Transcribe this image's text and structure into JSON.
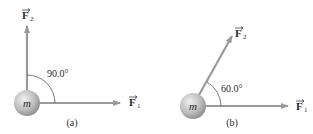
{
  "diagram": {
    "panels": [
      {
        "id": "a",
        "caption": "(a)",
        "mass_label": "m",
        "angle_label": "90.0°",
        "force1": {
          "name": "F",
          "subscript": "1"
        },
        "force2": {
          "name": "F",
          "subscript": "2"
        }
      },
      {
        "id": "b",
        "caption": "(b)",
        "mass_label": "m",
        "angle_label": "60.0°",
        "force1": {
          "name": "F",
          "subscript": "1"
        },
        "force2": {
          "name": "F",
          "subscript": "2"
        }
      }
    ],
    "colors": {
      "arrow": "#9a9a9a",
      "ball_light": "#e6e6e6",
      "ball_dark": "#8c8c8c",
      "text": "#2a2a2a"
    }
  }
}
